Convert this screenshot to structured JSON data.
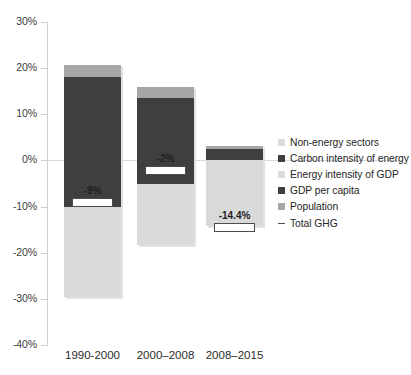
{
  "chart_data": {
    "type": "bar",
    "subtype": "stacked-bar-with-total-marker",
    "title": "",
    "xlabel": "",
    "ylabel": "",
    "categories": [
      "1990-2000",
      "2000–2008",
      "2008–2015"
    ],
    "ylim": [
      -40,
      30
    ],
    "ytick_labels": [
      "30%",
      "20%",
      "10%",
      "0%",
      "-10%",
      "-20%",
      "-30%",
      "-40%"
    ],
    "ytick_values": [
      30,
      20,
      10,
      0,
      -10,
      -20,
      -30,
      -40
    ],
    "grid": false,
    "legend_position": "right",
    "value_suffix": "%",
    "series": [
      {
        "name": "Non-energy sectors",
        "color": "#dcdcdc",
        "values": [
          0.0,
          0.0,
          0.0
        ]
      },
      {
        "name": "Carbon intensity of energy",
        "color": "#3f3f3f",
        "values": [
          -10.0,
          -5.2,
          2.5
        ]
      },
      {
        "name": "Energy intensity of GDP",
        "color": "#d9d9d9",
        "values": [
          -19.5,
          -13.2,
          -14.2
        ]
      },
      {
        "name": "GDP per capita",
        "color": "#3f3f3f",
        "values": [
          18.0,
          13.5,
          0.0
        ]
      },
      {
        "name": "Population",
        "color": "#a6a6a6",
        "values": [
          2.6,
          2.5,
          0.6
        ]
      }
    ],
    "total_ghg": {
      "name": "Total GHG",
      "color": "#4c4c4c",
      "values": [
        -9.0,
        -2.0,
        -14.4
      ],
      "labels": [
        "-9%",
        "-2%",
        "-14.4%"
      ]
    },
    "colors": {
      "dark_gray": "#3f3f3f",
      "medium_gray": "#a6a6a6",
      "light_gray": "#d9d9d9",
      "segment_carbon": "#595959",
      "axis": "#d0d0d0",
      "text": "#262626",
      "background": "#ffffff"
    }
  },
  "legend": {
    "items": [
      {
        "label": "Non-energy sectors",
        "swatch": "light"
      },
      {
        "label": "Carbon intensity of energy",
        "swatch": "dark"
      },
      {
        "label": "Energy intensity of GDP",
        "swatch": "light"
      },
      {
        "label": "GDP per capita",
        "swatch": "dark"
      },
      {
        "label": "Population",
        "swatch": "medium"
      },
      {
        "label": "Total GHG",
        "swatch": "dash"
      }
    ]
  },
  "axis": {
    "y_labels": [
      "30%",
      "20%",
      "10%",
      "0%",
      "-10%",
      "-20%",
      "-30%",
      "-40%"
    ],
    "x_labels": [
      "1990-2000",
      "2000–2008",
      "2008–2015"
    ]
  },
  "bar_labels": {
    "bar1": "-9%",
    "bar2": "-2%",
    "bar3": "-14.4%"
  }
}
